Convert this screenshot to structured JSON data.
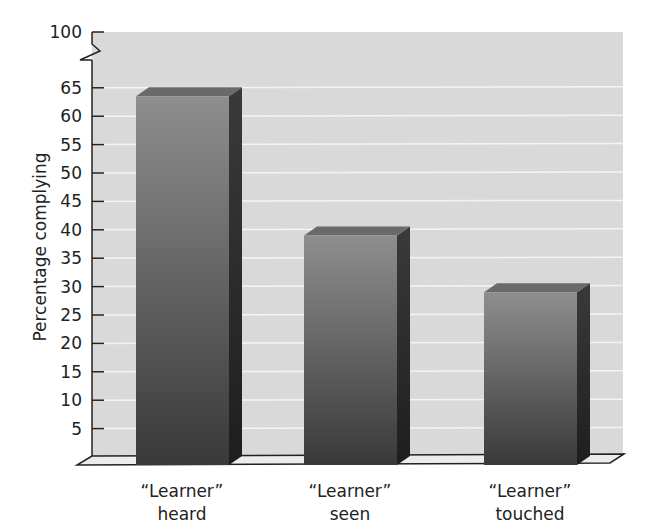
{
  "chart_data": {
    "type": "bar",
    "title": "",
    "xlabel": "",
    "ylabel": "Percentage complying",
    "categories": [
      [
        "“Learner”",
        "heard"
      ],
      [
        "“Learner”",
        "seen"
      ],
      [
        "“Learner”",
        "touched"
      ]
    ],
    "category_labels": [
      "“Learner” heard",
      "“Learner” seen",
      "“Learner” touched"
    ],
    "values": [
      63.5,
      39,
      29
    ],
    "ylim": [
      0,
      100
    ],
    "axis_break": {
      "between": [
        65,
        100
      ]
    },
    "yticks": [
      5,
      10,
      15,
      20,
      25,
      30,
      35,
      40,
      45,
      50,
      55,
      60,
      65,
      100
    ],
    "grid": true,
    "style": "3d-bars",
    "colors": {
      "plot_background": "#d9d9d9",
      "grid": "#f4f4f4",
      "bar_front_top": "#8c8c8c",
      "bar_front_bottom": "#3a3a3a",
      "bar_side": "#2a2a2a",
      "bar_top": "#6a6a6a",
      "axis": "#222222"
    }
  }
}
